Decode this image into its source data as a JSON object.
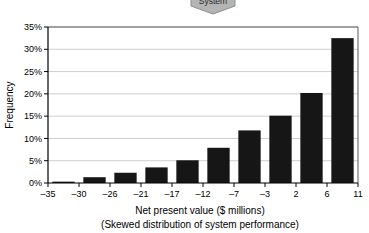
{
  "callout": {
    "label": "System",
    "shape": "banner-tag-down-arrow",
    "fill_color": "#b4b4b4",
    "border_color": "#8e8e8e",
    "text_color": "#2b2b2b"
  },
  "chart_data": {
    "type": "bar",
    "title": "",
    "subtitle": "",
    "xlabel": "Net present value ($ millions)",
    "xlabel_sub": "(Skewed distribution of system performance)",
    "ylabel": "Frequency",
    "categories": [
      "-35 to -30",
      "-30 to -26",
      "-26 to -21",
      "-21 to -17",
      "-17 to -12",
      "-12 to -7",
      "-7 to -3",
      "-3 to 2",
      "2 to 6",
      "6 to 11"
    ],
    "values": [
      0.3,
      1.3,
      2.3,
      3.5,
      5.1,
      7.9,
      11.8,
      15.1,
      20.2,
      32.5
    ],
    "bin_edges": [
      -35,
      -30,
      -26,
      -21,
      -17,
      -12,
      -7,
      -3,
      2,
      6,
      11
    ],
    "xtick_labels": [
      "–35",
      "–30",
      "–26",
      "–21",
      "–17",
      "–12",
      "–7",
      "–3",
      "2",
      "6",
      "11"
    ],
    "ytick_labels": [
      "0%",
      "5%",
      "10%",
      "15%",
      "20%",
      "25%",
      "30%",
      "35%"
    ],
    "ytick_values": [
      0,
      5,
      10,
      15,
      20,
      25,
      30,
      35
    ],
    "ylim": [
      0,
      35
    ],
    "xlim": [
      -35,
      11
    ],
    "grid": "horizontal",
    "legend": "none",
    "bar_color": "#161616",
    "gridline_color": "#b9b9b9",
    "axis_color": "#000000"
  }
}
